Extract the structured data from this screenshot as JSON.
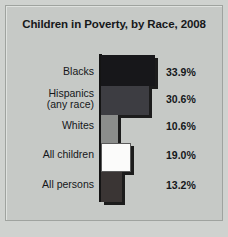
{
  "chart_data": {
    "type": "bar",
    "orientation": "horizontal",
    "title": "Children in Poverty, by Race, 2008",
    "xlabel": "",
    "ylabel": "",
    "categories": [
      "Blacks",
      "Hispanics (any race)",
      "Whites",
      "All children",
      "All persons"
    ],
    "values": [
      33.9,
      30.6,
      10.6,
      19.0,
      13.2
    ],
    "value_labels": [
      "33.9%",
      "30.6%",
      "10.6%",
      "19.0%",
      "13.2%"
    ],
    "xlim": [
      0,
      36
    ],
    "grid": false,
    "legend": false,
    "bar_colors": [
      "#17171a",
      "#3d3d42",
      "#8b8d8b",
      "#fbfbfa",
      "#3a3534"
    ],
    "background": "#c6c9c6",
    "bars": [
      {
        "category": "Blacks",
        "label_lines": [
          "Blacks"
        ],
        "value": 33.9,
        "value_label": "33.9%",
        "color": "#17171a"
      },
      {
        "category": "Hispanics (any race)",
        "label_lines": [
          "Hispanics",
          "(any race)"
        ],
        "value": 30.6,
        "value_label": "30.6%",
        "color": "#3d3d42"
      },
      {
        "category": "Whites",
        "label_lines": [
          "Whites"
        ],
        "value": 10.6,
        "value_label": "10.6%",
        "color": "#8b8d8b"
      },
      {
        "category": "All children",
        "label_lines": [
          "All children"
        ],
        "value": 19.0,
        "value_label": "19.0%",
        "color": "#fbfbfa"
      },
      {
        "category": "All persons",
        "label_lines": [
          "All persons"
        ],
        "value": 13.2,
        "value_label": "13.2%",
        "color": "#3a3534"
      }
    ]
  }
}
